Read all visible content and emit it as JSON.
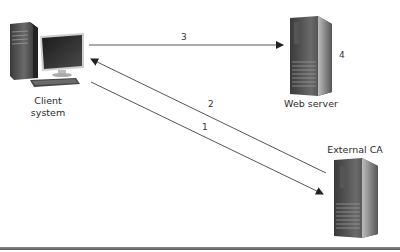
{
  "nodes": {
    "client": {
      "label_line1": "Client",
      "label_line2": "system"
    },
    "web_server": {
      "label": "Web server",
      "step_label": "4"
    },
    "external_ca": {
      "label": "External CA"
    }
  },
  "arrows": [
    {
      "step": "1",
      "from": "client",
      "to": "external_ca"
    },
    {
      "step": "2",
      "from": "external_ca",
      "to": "client"
    },
    {
      "step": "3",
      "from": "client",
      "to": "web_server"
    }
  ],
  "colors": {
    "line": "#555555",
    "arrowhead": "#222222",
    "rule": "#6e6e6e"
  }
}
